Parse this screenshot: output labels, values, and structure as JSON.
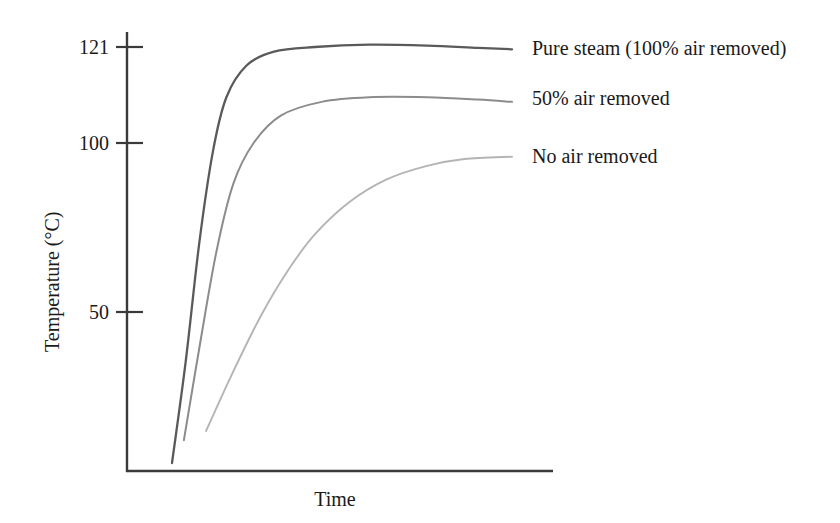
{
  "chart_data": {
    "type": "line",
    "title": "",
    "xlabel": "Time",
    "ylabel": "Temperature (°C)",
    "x_tick_labels": [],
    "y_tick_labels": [
      "121",
      "100",
      "50"
    ],
    "y_ticks": [
      121,
      100,
      50
    ],
    "grid": false,
    "legend_position": "right-inline",
    "xlim": [
      0,
      1
    ],
    "ylim": [
      0,
      130
    ],
    "series": [
      {
        "name": "Pure steam (100% air removed)",
        "color": "#5a5a5a",
        "plateau_value": 121,
        "start_value": 30,
        "points": [
          [
            0.0,
            30
          ],
          [
            0.04,
            52
          ],
          [
            0.08,
            78
          ],
          [
            0.12,
            98
          ],
          [
            0.16,
            110
          ],
          [
            0.22,
            117
          ],
          [
            0.3,
            120
          ],
          [
            0.42,
            121
          ],
          [
            0.58,
            121.5
          ],
          [
            0.75,
            121.3
          ],
          [
            0.9,
            120.8
          ],
          [
            1.0,
            120.5
          ]
        ]
      },
      {
        "name": "50% air removed",
        "color": "#8c8c8c",
        "plateau_value": 110,
        "start_value": 35,
        "points": [
          [
            0.035,
            35
          ],
          [
            0.08,
            55
          ],
          [
            0.13,
            76
          ],
          [
            0.18,
            91
          ],
          [
            0.24,
            100
          ],
          [
            0.32,
            106
          ],
          [
            0.44,
            109
          ],
          [
            0.58,
            110
          ],
          [
            0.75,
            110
          ],
          [
            0.9,
            109.5
          ],
          [
            1.0,
            109
          ]
        ]
      },
      {
        "name": "No air removed",
        "color": "#b4b4b4",
        "plateau_value": 97,
        "start_value": 37,
        "points": [
          [
            0.1,
            37
          ],
          [
            0.18,
            50
          ],
          [
            0.26,
            62
          ],
          [
            0.34,
            72
          ],
          [
            0.42,
            80
          ],
          [
            0.52,
            87
          ],
          [
            0.63,
            92
          ],
          [
            0.75,
            95
          ],
          [
            0.86,
            96.5
          ],
          [
            1.0,
            97
          ]
        ]
      }
    ],
    "axis_color": "#3a3a3a"
  },
  "axes": {
    "y_label": "Temperature (°C)",
    "x_label": "Time",
    "tick_121": "121",
    "tick_100": "100",
    "tick_50": "50"
  },
  "legend": {
    "items": [
      {
        "label": "Pure steam (100% air removed)"
      },
      {
        "label": "50% air removed"
      },
      {
        "label": "No air removed"
      }
    ]
  }
}
